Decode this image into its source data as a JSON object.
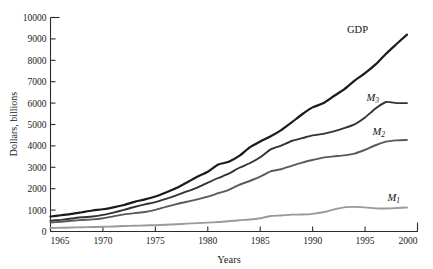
{
  "chart_data": {
    "type": "line",
    "title": "",
    "xlabel": "Years",
    "ylabel": "Dollars, billions",
    "xlim": [
      1965,
      2000
    ],
    "ylim": [
      0,
      10000
    ],
    "grid": false,
    "legend_position": "curve-end-labels",
    "xticks": [
      1965,
      1970,
      1975,
      1980,
      1985,
      1990,
      1995,
      2000
    ],
    "yticks": [
      0,
      1000,
      2000,
      3000,
      4000,
      5000,
      6000,
      7000,
      8000,
      9000,
      10000
    ],
    "x": [
      1965,
      1966,
      1967,
      1968,
      1969,
      1970,
      1971,
      1972,
      1973,
      1974,
      1975,
      1976,
      1977,
      1978,
      1979,
      1980,
      1981,
      1982,
      1983,
      1984,
      1985,
      1986,
      1987,
      1988,
      1989,
      1990,
      1991,
      1992,
      1993,
      1994,
      1995,
      1996,
      1997,
      1998,
      1999
    ],
    "series": [
      {
        "name": "GDP",
        "label": "GDP",
        "color": "#1a1a1a",
        "width": 2.2,
        "values": [
          700,
          760,
          820,
          900,
          980,
          1040,
          1130,
          1240,
          1385,
          1500,
          1635,
          1825,
          2030,
          2290,
          2560,
          2790,
          3130,
          3260,
          3530,
          3930,
          4210,
          4450,
          4740,
          5100,
          5480,
          5800,
          5990,
          6320,
          6640,
          7050,
          7400,
          7810,
          8310,
          8760,
          9200
        ]
      },
      {
        "name": "M3",
        "label": "M₃",
        "color": "#333333",
        "width": 1.9,
        "values": [
          500,
          545,
          605,
          665,
          700,
          775,
          885,
          1010,
          1145,
          1265,
          1370,
          1520,
          1690,
          1870,
          2050,
          2280,
          2500,
          2700,
          2980,
          3190,
          3470,
          3840,
          4010,
          4230,
          4360,
          4490,
          4560,
          4680,
          4830,
          5010,
          5330,
          5750,
          6050,
          6000,
          6000
        ]
      },
      {
        "name": "M2",
        "label": "M₂",
        "color": "#5a5a5a",
        "width": 1.9,
        "values": [
          420,
          455,
          500,
          540,
          565,
          620,
          710,
          800,
          860,
          910,
          1010,
          1150,
          1280,
          1390,
          1500,
          1630,
          1790,
          1950,
          2180,
          2360,
          2560,
          2810,
          2910,
          3070,
          3220,
          3340,
          3450,
          3510,
          3560,
          3640,
          3820,
          4030,
          4200,
          4260,
          4280
        ]
      },
      {
        "name": "M1",
        "label": "M₁",
        "color": "#9a9a9a",
        "width": 1.9,
        "values": [
          165,
          172,
          184,
          199,
          207,
          221,
          236,
          256,
          270,
          283,
          295,
          314,
          339,
          367,
          390,
          415,
          441,
          480,
          528,
          560,
          620,
          725,
          750,
          787,
          794,
          826,
          898,
          1025,
          1130,
          1150,
          1128,
          1082,
          1074,
          1095,
          1120
        ]
      }
    ]
  }
}
